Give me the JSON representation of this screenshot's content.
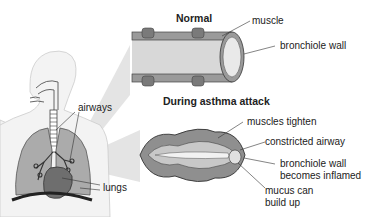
{
  "diagram": {
    "sections": {
      "normal": {
        "title": "Normal",
        "labels": {
          "muscle": "muscle",
          "bronchiole_wall": "bronchiole wall"
        }
      },
      "asthma": {
        "title": "During asthma attack",
        "labels": {
          "muscles_tighten": "muscles tighten",
          "constricted_airway": "constricted airway",
          "inflamed_line1": "bronchiole wall",
          "inflamed_line2": "becomes inflamed",
          "mucus_line1": "mucus can",
          "mucus_line2": "build up"
        }
      }
    },
    "body_labels": {
      "airways": "airways",
      "lungs": "lungs"
    },
    "colors": {
      "tube_dark": "#6f6f6f",
      "tube_mid": "#a6a6a6",
      "tube_light": "#d9d9d9",
      "lung": "#a8a8a8",
      "heart": "#6e6e6e",
      "body_outline": "#cfcfcf",
      "callout_beam": "#e2e2e2"
    }
  }
}
